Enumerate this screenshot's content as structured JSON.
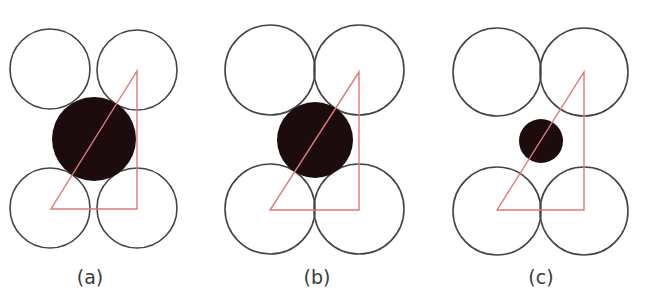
{
  "figure": {
    "colors": {
      "outline": "#444444",
      "interstitial_fill": "#1c0c0e",
      "triangle": "#e07878",
      "label": "#3a3a3a",
      "background": "#ffffff"
    },
    "panels": [
      {
        "id": "a",
        "label": "(a)",
        "label_pos": [
          90,
          284
        ],
        "host_circles": [
          {
            "cx": 50,
            "cy": 69,
            "r": 40
          },
          {
            "cx": 137,
            "cy": 70,
            "r": 40
          },
          {
            "cx": 50,
            "cy": 208,
            "r": 40
          },
          {
            "cx": 137,
            "cy": 208,
            "r": 40
          }
        ],
        "interstitial": {
          "cx": 94,
          "cy": 139,
          "r": 42,
          "fit": "too large"
        },
        "triangle": [
          [
            51,
            209
          ],
          [
            137,
            209
          ],
          [
            137,
            71
          ]
        ]
      },
      {
        "id": "b",
        "label": "(b)",
        "label_pos": [
          317,
          284
        ],
        "host_circles": [
          {
            "cx": 270,
            "cy": 70,
            "r": 45
          },
          {
            "cx": 359,
            "cy": 70,
            "r": 45
          },
          {
            "cx": 270,
            "cy": 209,
            "r": 45
          },
          {
            "cx": 359,
            "cy": 209,
            "r": 45
          }
        ],
        "interstitial": {
          "cx": 315,
          "cy": 140,
          "r": 38,
          "fit": "just fits"
        },
        "triangle": [
          [
            270,
            210
          ],
          [
            359,
            210
          ],
          [
            359,
            72
          ]
        ]
      },
      {
        "id": "c",
        "label": "(c)",
        "label_pos": [
          541,
          284
        ],
        "host_circles": [
          {
            "cx": 497,
            "cy": 72,
            "r": 44
          },
          {
            "cx": 584,
            "cy": 72,
            "r": 44
          },
          {
            "cx": 497,
            "cy": 211,
            "r": 44
          },
          {
            "cx": 584,
            "cy": 211,
            "r": 44
          }
        ],
        "interstitial": {
          "cx": 541,
          "cy": 141,
          "r": 22,
          "fit": "too small"
        },
        "triangle": [
          [
            497,
            210
          ],
          [
            584,
            210
          ],
          [
            584,
            72
          ]
        ]
      }
    ]
  }
}
